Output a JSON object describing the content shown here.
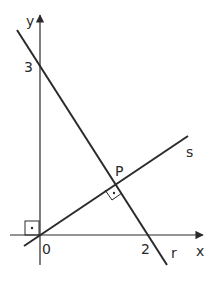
{
  "figure": {
    "axes": {
      "x_label": "x",
      "y_label": "y",
      "origin_label": "0",
      "x_tick_label": "2",
      "y_tick_label": "3"
    },
    "lines": {
      "r": {
        "label": "r",
        "passes_through": [
          "(0,3)",
          "(2,0)"
        ]
      },
      "s": {
        "label": "s",
        "passes_through": [
          "(0,0)",
          "P"
        ],
        "perpendicular_to": "r"
      }
    },
    "points": {
      "P": {
        "label": "P",
        "description": "intersection of r and s"
      }
    },
    "right_angle_marks": [
      "origin",
      "P"
    ],
    "colors": {
      "stroke": "#2a2a2a",
      "background": "#ffffff"
    }
  }
}
